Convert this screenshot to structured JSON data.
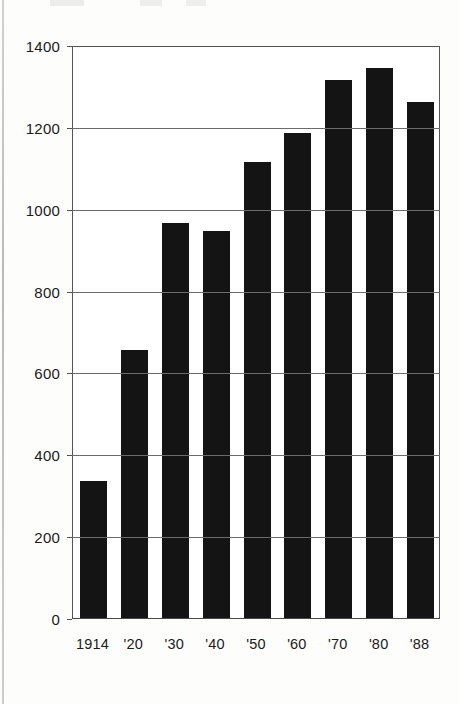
{
  "figure": {
    "background_color": "#ffffff",
    "bar_color": "#141414",
    "axis_color": "#545454",
    "gridline_color": "#6b6b6b",
    "text_color": "#1b1b1b"
  },
  "chart_data": {
    "type": "bar",
    "title": "",
    "subtitle": "",
    "xlabel": "",
    "ylabel": "",
    "categories": [
      "1914",
      "'20",
      "'30",
      "'40",
      "'50",
      "'60",
      "'70",
      "'80",
      "'88"
    ],
    "values": [
      335,
      655,
      965,
      945,
      1115,
      1185,
      1315,
      1345,
      1260
    ],
    "series": [
      {
        "name": "",
        "values": [
          335,
          655,
          965,
          945,
          1115,
          1185,
          1315,
          1345,
          1260
        ]
      }
    ],
    "ylim": [
      0,
      1400
    ],
    "xlim_note": "categorical",
    "yticks": [
      0,
      200,
      400,
      600,
      800,
      1000,
      1200,
      1400
    ],
    "ytick_labels": [
      "0",
      "200",
      "400",
      "600",
      "800",
      "1000",
      "1200",
      "1400"
    ],
    "grid": "horizontal",
    "legend": "none",
    "legend_position": "",
    "annotations": []
  }
}
